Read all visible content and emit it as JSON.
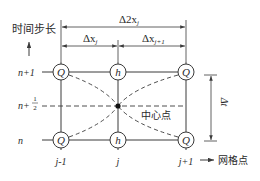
{
  "diagram": {
    "type": "staggered-grid-scheme",
    "axes": {
      "time_axis_label": "时间步长",
      "space_axis_label": "网格点"
    },
    "time_levels": {
      "upper": "n+1",
      "half_prefix": "n+",
      "half_num": "1",
      "half_den": "2",
      "lower": "n"
    },
    "space_indices": {
      "left": "j-1",
      "center": "j",
      "right": "j+1"
    },
    "spacing_labels": {
      "total_delta": "Δ2x",
      "total_sub": "j",
      "left_delta": "Δx",
      "left_sub": "j",
      "right_delta": "Δx",
      "right_sub": "j+1",
      "time_delta": "Δt"
    },
    "nodes": {
      "top_left": "Q",
      "top_center": "h",
      "top_right": "Q",
      "bottom_left": "Q",
      "bottom_center": "h",
      "bottom_right": "Q"
    },
    "center_point_label": "中心点",
    "colors": {
      "line": "#3a3a3a",
      "text": "#2a2a2a",
      "background": "#ffffff"
    }
  }
}
